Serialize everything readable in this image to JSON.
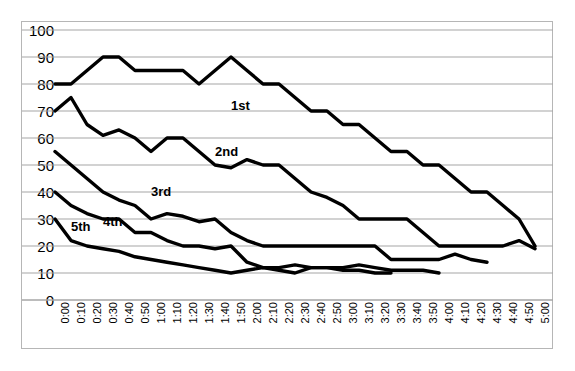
{
  "chart_data": {
    "type": "line",
    "title": "",
    "xlabel": "",
    "ylabel": "",
    "ylim": [
      0,
      100
    ],
    "ytick_step": 10,
    "grid": true,
    "grid_color": "#a6a6a6",
    "line_color": "#000000",
    "legend_position": "inline-annotations",
    "x": [
      "0:00",
      "0:10",
      "0:20",
      "0:30",
      "0:40",
      "0:50",
      "1:00",
      "1:10",
      "1:20",
      "1:30",
      "1:40",
      "1:50",
      "2:00",
      "2:10",
      "2:20",
      "2:30",
      "2:40",
      "2:50",
      "3:00",
      "3:10",
      "3:20",
      "3:30",
      "3:40",
      "3:50",
      "4:00",
      "4:10",
      "4:20",
      "4:30",
      "4:40",
      "4:50",
      "5:00"
    ],
    "yticks": [
      0,
      10,
      20,
      30,
      40,
      50,
      60,
      70,
      80,
      90,
      100
    ],
    "series": [
      {
        "name": "1st",
        "label_x": "1:50",
        "label_y": 72,
        "values": [
          80,
          80,
          85,
          90,
          90,
          85,
          85,
          85,
          85,
          80,
          85,
          90,
          85,
          80,
          80,
          75,
          70,
          70,
          65,
          65,
          60,
          55,
          55,
          50,
          50,
          45,
          40,
          40,
          35,
          30,
          20
        ]
      },
      {
        "name": "2nd",
        "label_x": "1:40",
        "label_y": 55,
        "values": [
          70,
          75,
          65,
          61,
          63,
          60,
          55,
          60,
          60,
          55,
          50,
          49,
          52,
          50,
          50,
          45,
          40,
          38,
          35,
          30,
          30,
          30,
          30,
          25,
          20,
          20,
          20,
          20,
          20,
          22,
          19
        ]
      },
      {
        "name": "3rd",
        "label_x": "1:00",
        "label_y": 40,
        "values": [
          55,
          50,
          45,
          40,
          37,
          35,
          30,
          32,
          31,
          29,
          30,
          25,
          22,
          20,
          20,
          20,
          20,
          20,
          20,
          20,
          20,
          15,
          15,
          15,
          15,
          17,
          15,
          14,
          null,
          null,
          null
        ]
      },
      {
        "name": "4th",
        "label_x": "0:30",
        "label_y": 29,
        "values": [
          40,
          35,
          32,
          30,
          30,
          25,
          25,
          22,
          20,
          20,
          19,
          20,
          14,
          12,
          12,
          13,
          12,
          12,
          12,
          13,
          12,
          11,
          11,
          11,
          10,
          null,
          null,
          null,
          null,
          null,
          null
        ]
      },
      {
        "name": "5th",
        "label_x": "0:10",
        "label_y": 27,
        "values": [
          30,
          22,
          20,
          19,
          18,
          16,
          15,
          14,
          13,
          12,
          11,
          10,
          11,
          12,
          11,
          10,
          12,
          12,
          11,
          11,
          10,
          10,
          null,
          null,
          null,
          null,
          null,
          null,
          null,
          null,
          null
        ]
      }
    ]
  }
}
